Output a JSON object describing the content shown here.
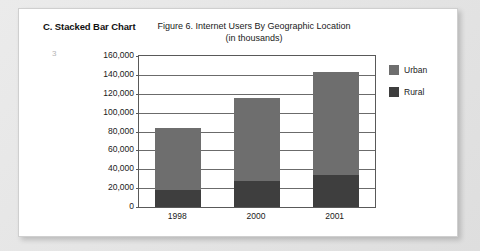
{
  "document": {
    "section_title": "C. Stacked Bar Chart",
    "page_number": "3"
  },
  "colors": {
    "urban": "#6e6e6e",
    "rural": "#3e3e3e",
    "axis": "#595959",
    "grid": "#6b6b6b",
    "paper": "#ffffff",
    "backdrop": "#e8e8e8"
  },
  "chart_data": {
    "type": "bar",
    "subtype": "stacked",
    "title": "Figure 6. Internet Users By Geographic Location",
    "subtitle": "(in thousands)",
    "xlabel": "",
    "ylabel": "",
    "categories": [
      "1998",
      "2000",
      "2001"
    ],
    "series": [
      {
        "name": "Rural",
        "values": [
          18000,
          28000,
          34000
        ],
        "color": "#3e3e3e"
      },
      {
        "name": "Urban",
        "values": [
          66000,
          88000,
          109000
        ],
        "color": "#6e6e6e"
      }
    ],
    "totals": [
      84000,
      116000,
      143000
    ],
    "ylim": [
      0,
      160000
    ],
    "ytick_step": 20000,
    "ytick_labels": [
      "160,000",
      "140,000",
      "120,000",
      "100,000",
      "80,000",
      "60,000",
      "40,000",
      "20,000",
      "0"
    ],
    "ytick_values": [
      160000,
      140000,
      120000,
      100000,
      80000,
      60000,
      40000,
      20000,
      0
    ],
    "grid": true,
    "legend": {
      "position": "right",
      "entries": [
        "Urban",
        "Rural"
      ]
    }
  }
}
